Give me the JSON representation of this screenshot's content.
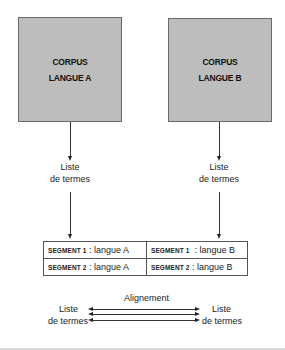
{
  "corpus_a": {
    "line1": "CORPUS",
    "line2": "LANGUE A"
  },
  "corpus_b": {
    "line1": "CORPUS",
    "line2": "LANGUE B"
  },
  "term_list_a": {
    "line1": "Liste",
    "line2": "de termes"
  },
  "term_list_b": {
    "line1": "Liste",
    "line2": "de termes"
  },
  "segments": {
    "rows": [
      {
        "a_key": "SEGMENT 1",
        "a_val": " : langue A",
        "b_key": "SEGMENT 1",
        "b_val": "  : langue B"
      },
      {
        "a_key": "SEGMENT 2",
        "a_val": " : langue A",
        "b_key": "SEGMENT 2",
        "b_val": " : langue B"
      }
    ]
  },
  "alignment": {
    "title": "Alignement",
    "left": {
      "line1": "Liste",
      "line2": "de termes"
    },
    "right": {
      "line1": "Liste",
      "line2": "de termes"
    }
  },
  "colors": {
    "box_fill": "#bdbdbd",
    "box_border": "#6a6a6a",
    "line": "#333333"
  }
}
